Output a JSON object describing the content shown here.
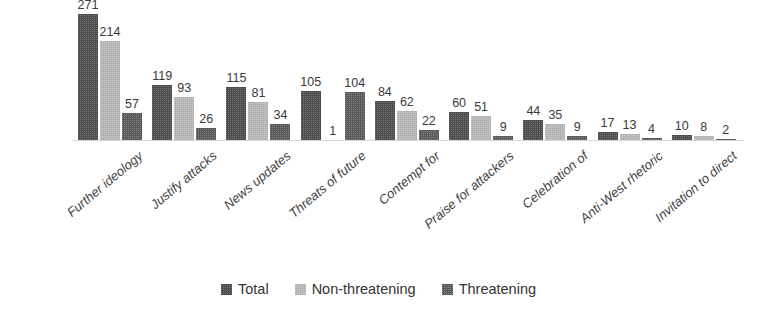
{
  "chart_data": {
    "type": "bar",
    "title": "",
    "subtitle": "",
    "xlabel": "",
    "ylabel": "",
    "ylim": [
      0,
      271
    ],
    "grid": false,
    "legend_position": "bottom-center",
    "data_labels_shown": true,
    "categories": [
      "Further ideology",
      "Justify attacks",
      "News updates",
      "Threats of future",
      "Contempt for",
      "Praise for attackers",
      "Celebration of",
      "Anti-West rhetoric",
      "Invitation to direct"
    ],
    "series": [
      {
        "name": "Total",
        "color": "#4d4d4d",
        "values": [
          271,
          119,
          115,
          105,
          84,
          60,
          44,
          17,
          10
        ]
      },
      {
        "name": "Non-threatening",
        "color": "#b2b2b2",
        "values": [
          214,
          93,
          81,
          1,
          62,
          51,
          35,
          13,
          8
        ]
      },
      {
        "name": "Threatening",
        "color": "#595959",
        "values": [
          57,
          26,
          34,
          104,
          22,
          9,
          9,
          4,
          2
        ]
      }
    ]
  },
  "legend": {
    "items": [
      {
        "label": "Total"
      },
      {
        "label": "Non-threatening"
      },
      {
        "label": "Threatening"
      }
    ]
  },
  "colors": {
    "total": "#4d4d4d",
    "non_threatening": "#b2b2b2",
    "threatening": "#595959",
    "axis_line": "#d5d5d5",
    "text": "#3a3a3a",
    "background": "#ffffff"
  }
}
